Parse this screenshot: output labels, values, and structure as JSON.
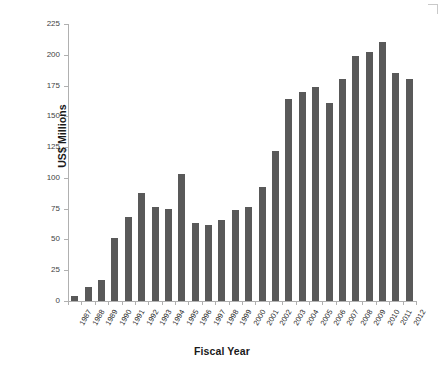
{
  "chart_data": {
    "type": "bar",
    "title": "",
    "xlabel": "Fiscal Year",
    "ylabel": "US$ Millions",
    "ylim": [
      0,
      225
    ],
    "ytick_values": [
      0,
      25,
      50,
      75,
      100,
      125,
      150,
      175,
      200,
      225
    ],
    "ytick_labels": [
      "0",
      "25",
      "50",
      "75",
      "100",
      "125",
      "150",
      "175",
      "200",
      "225"
    ],
    "grid": false,
    "legend": null,
    "bar_color": "#595959",
    "categories": [
      "1987",
      "1988",
      "1989",
      "1990",
      "1991",
      "1992",
      "1993",
      "1994",
      "1995",
      "1996",
      "1997",
      "1998",
      "1999",
      "2000",
      "2001",
      "2002",
      "2003",
      "2004",
      "2005",
      "2006",
      "2007",
      "2008",
      "2009",
      "2010",
      "2011",
      "2012"
    ],
    "values": [
      4,
      11,
      17,
      51,
      68,
      88,
      76,
      75,
      103,
      63,
      62,
      66,
      74,
      76,
      93,
      122,
      164,
      170,
      174,
      161,
      180,
      199,
      202,
      210,
      185,
      180
    ]
  }
}
